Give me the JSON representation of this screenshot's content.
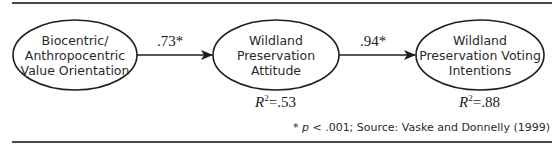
{
  "diagram": {
    "nodes": [
      {
        "id": "value_orientation",
        "lines": [
          "Biocentric/",
          "Anthropocentric",
          "Value Orientation"
        ]
      },
      {
        "id": "attitude",
        "lines": [
          "Wildland",
          "Preservation",
          "Attitude"
        ],
        "r2_label": "R",
        "r2_sup": "2",
        "r2_value": "=.53"
      },
      {
        "id": "voting_intentions",
        "lines": [
          "Wildland",
          "Preservation Voting",
          "Intentions"
        ],
        "r2_label": "R",
        "r2_sup": "2",
        "r2_value": "=.88"
      }
    ],
    "edges": [
      {
        "from": "value_orientation",
        "to": "attitude",
        "coefficient": ".73*"
      },
      {
        "from": "attitude",
        "to": "voting_intentions",
        "coefficient": ".94*"
      }
    ],
    "footnote": {
      "star": "* ",
      "p": "p",
      "rest": " < .001; Source: Vaske and Donnelly (1999)"
    },
    "colors": {
      "stroke": "#1e1e1e",
      "rule": "#4a4a4a",
      "text": "#2a2a2a"
    }
  }
}
